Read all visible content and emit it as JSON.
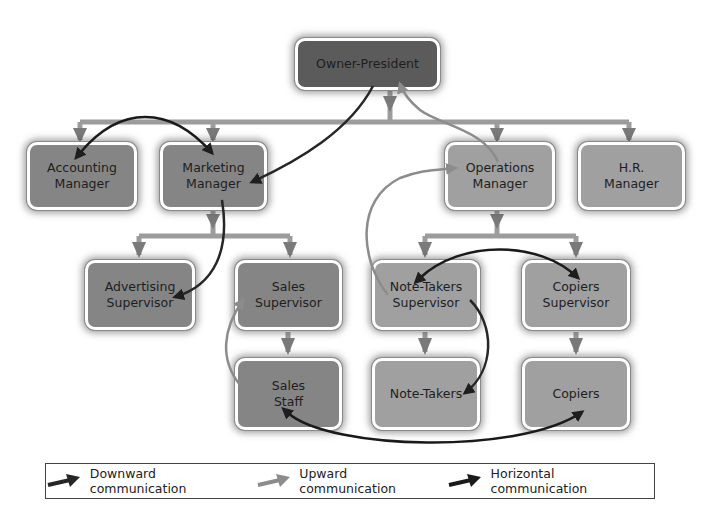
{
  "diagram": {
    "nodes": {
      "owner": "Owner-President",
      "accounting": "Accounting\nManager",
      "marketing": "Marketing\nManager",
      "operations": "Operations\nManager",
      "hr": "H.R.\nManager",
      "advertising": "Advertising\nSupervisor",
      "sales_sup": "Sales\nSupervisor",
      "notetakers_sup": "Note-Takers\nSupervisor",
      "copiers_sup": "Copiers\nSupervisor",
      "sales_staff": "Sales\nStaff",
      "notetakers": "Note-Takers",
      "copiers": "Copiers"
    },
    "colors": {
      "downward": "#262626",
      "upward": "#8c8c8c",
      "horizontal": "#1a1a1a",
      "connector": "#9a9a9a",
      "box_dark": "#5b5b5b",
      "box_mid": "#858585",
      "box_light": "#a0a0a0"
    }
  },
  "legend": {
    "downward": "Downward communication",
    "upward": "Upward communication",
    "horizontal": "Horizontal communication"
  }
}
